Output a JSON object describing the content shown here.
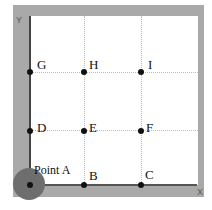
{
  "axes": {
    "x_label": "X",
    "y_label": "Y"
  },
  "points": [
    {
      "id": "A",
      "label": "Point A"
    },
    {
      "id": "B",
      "label": "B"
    },
    {
      "id": "C",
      "label": "C"
    },
    {
      "id": "D",
      "label": "D"
    },
    {
      "id": "E",
      "label": "E"
    },
    {
      "id": "F",
      "label": "F"
    },
    {
      "id": "G",
      "label": "G"
    },
    {
      "id": "H",
      "label": "H"
    },
    {
      "id": "I",
      "label": "I"
    }
  ],
  "colors": {
    "frame": "#a9a9a9",
    "marker": "#6e6e6e",
    "point": "#111111"
  }
}
